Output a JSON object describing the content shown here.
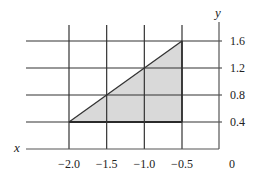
{
  "chart_data": {
    "type": "area",
    "title": "",
    "xlabel": "x",
    "ylabel": "y",
    "x_ticks": [
      -2.0,
      -1.5,
      -1.0,
      -0.5,
      0
    ],
    "x_tick_labels": [
      "−2.0",
      "−1.5",
      "−1.0",
      "−0.5",
      "0"
    ],
    "y_ticks": [
      0.4,
      0.8,
      1.2,
      1.6
    ],
    "y_tick_labels": [
      "0.4",
      "0.8",
      "1.2",
      "1.6"
    ],
    "xlim": [
      -2.4,
      0
    ],
    "ylim": [
      0,
      1.6
    ],
    "grid": true,
    "legend": null,
    "shaded_region": {
      "shape": "triangle",
      "vertices": [
        [
          -2.0,
          0.4
        ],
        [
          -0.5,
          0.4
        ],
        [
          -0.5,
          1.6
        ]
      ],
      "fill": "#d9d9d9",
      "edge_color": "#333333"
    },
    "line": {
      "x": [
        -2.0,
        -0.5
      ],
      "y": [
        0.4,
        1.6
      ]
    }
  },
  "axes": {
    "x_label": "x",
    "y_label": "y"
  },
  "colors": {
    "grid": "#333333",
    "axis": "#555555",
    "fill": "#d9d9d9"
  }
}
